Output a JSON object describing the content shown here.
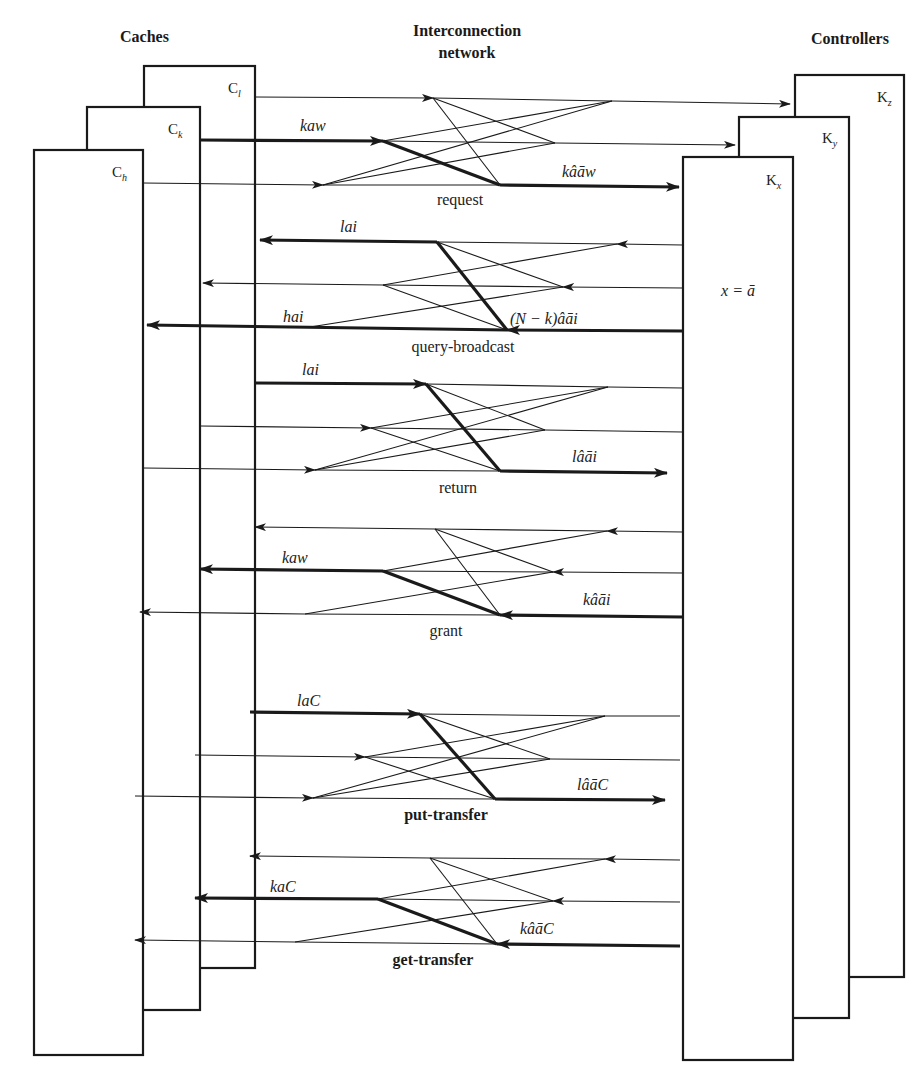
{
  "headers": {
    "caches": "Caches",
    "network_line1": "Interconnection",
    "network_line2": "network",
    "controllers": "Controllers"
  },
  "caches": [
    {
      "id": "C_l",
      "letter": "C",
      "subscript": "l"
    },
    {
      "id": "C_k",
      "letter": "C",
      "subscript": "k"
    },
    {
      "id": "C_h",
      "letter": "C",
      "subscript": "h"
    }
  ],
  "controllers": [
    {
      "id": "K_z",
      "letter": "K",
      "subscript": "z"
    },
    {
      "id": "K_y",
      "letter": "K",
      "subscript": "y"
    },
    {
      "id": "K_x",
      "letter": "K",
      "subscript": "x"
    }
  ],
  "controller_state": "x = ā",
  "phases": [
    {
      "name": "request",
      "bold": false,
      "direction": "to-controllers",
      "left_message": "kaw",
      "right_message": "kâāw"
    },
    {
      "name": "query-broadcast",
      "bold": false,
      "direction": "to-caches",
      "left_messages": [
        "lai",
        "hai"
      ],
      "right_message": "(N − k)âāi"
    },
    {
      "name": "return",
      "bold": false,
      "direction": "to-controllers",
      "left_message": "lai",
      "right_message": "lâāi"
    },
    {
      "name": "grant",
      "bold": false,
      "direction": "to-caches",
      "left_message": "kaw",
      "right_message": "kâāi"
    },
    {
      "name": "put-transfer",
      "bold": true,
      "direction": "to-controllers",
      "left_message": "laC",
      "right_message": "lâāC"
    },
    {
      "name": "get-transfer",
      "bold": true,
      "direction": "to-caches",
      "left_message": "kaC",
      "right_message": "kâāC"
    }
  ]
}
